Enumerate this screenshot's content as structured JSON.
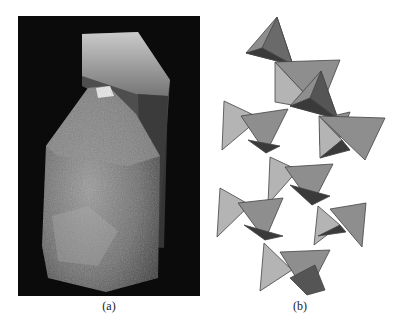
{
  "figure": {
    "panel_a": {
      "caption": "(a)",
      "subject": "quartz crystal photograph"
    },
    "panel_b": {
      "caption": "(b)",
      "subject": "linked tetrahedra structure"
    }
  },
  "colors": {
    "background": "#ffffff",
    "photo_background": "#0b0b0b",
    "face_light": "#b4b4b4",
    "face_mid": "#8e8e8e",
    "face_dark": "#555555",
    "face_darkest": "#3a3a3a",
    "edge": "#444444"
  }
}
